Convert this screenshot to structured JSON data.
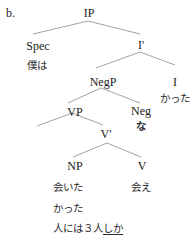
{
  "example_label": "b.",
  "nodes": {
    "ip": "IP",
    "spec": "Spec",
    "spec_word": "僕は",
    "i_bar": "I'",
    "negp": "NegP",
    "i": "I",
    "i_word": "かった",
    "vp": "VP",
    "neg": "Neg",
    "neg_word": "な",
    "v_bar": "V'",
    "np": "NP",
    "v": "V",
    "np_word_line1": "会いた",
    "np_word_line2": "かった",
    "np_word_line3_pre": "人には３人",
    "np_word_line3_underlined": "しか",
    "v_word": "会え"
  }
}
